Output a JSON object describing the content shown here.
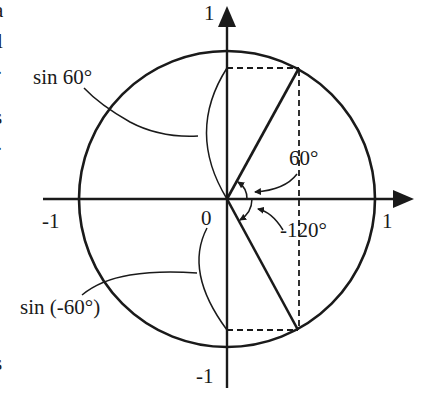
{
  "diagram": {
    "title": "",
    "colors": {
      "ink": "#1a1a1a",
      "background": "#ffffff"
    },
    "axes": {
      "x_tick_neg": "-1",
      "x_tick_pos": "1",
      "y_tick_pos": "1",
      "y_tick_neg": "-1",
      "origin": "0"
    },
    "angles": {
      "positive": "60°",
      "negative": "-120°"
    },
    "labels": {
      "sin_positive": "sin 60°",
      "sin_negative": "sin (-60°)"
    },
    "edge_fragments": [
      "a",
      "l",
      "·",
      "s",
      "·",
      "s"
    ]
  }
}
